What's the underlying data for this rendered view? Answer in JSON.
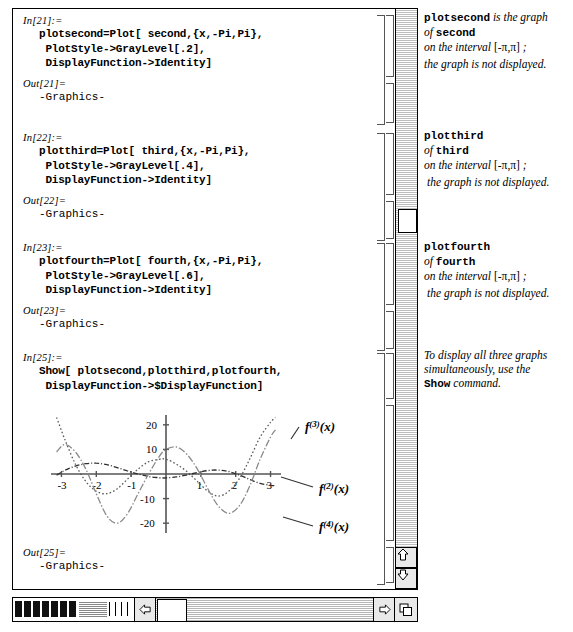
{
  "window": {
    "title": "Mathematica Notebook"
  },
  "cells": [
    {
      "in_label": "In[21]:=",
      "in_code": "plotsecond=Plot[ second,{x,-Pi,Pi},\n PlotStyle->GrayLevel[.2],\n DisplayFunction->Identity]",
      "out_label": "Out[21]=",
      "out_code": "-Graphics-"
    },
    {
      "in_label": "In[22]:=",
      "in_code": "plotthird=Plot[ third,{x,-Pi,Pi},\n PlotStyle->GrayLevel[.4],\n DisplayFunction->Identity]",
      "out_label": "Out[22]=",
      "out_code": "-Graphics-"
    },
    {
      "in_label": "In[23]:=",
      "in_code": "plotfourth=Plot[ fourth,{x,-Pi,Pi},\n PlotStyle->GrayLevel[.6],\n DisplayFunction->Identity]",
      "out_label": "Out[23]=",
      "out_code": "-Graphics-"
    },
    {
      "in_label": "In[25]:=",
      "in_code": "Show[ plotsecond,plotthird,plotfourth,\n DisplayFunction->$DisplayFunction]",
      "out_label": "Out[25]=",
      "out_code": "-Graphics-"
    }
  ],
  "notes": [
    {
      "line1_bold": "plotsecond",
      "line1_rest": " is the graph",
      "line2_pre": "of ",
      "line2_bold": "second",
      "line3": "on the interval ",
      "line3_interval": "[-π,π]",
      "line3_end": " ;",
      "line4": "the graph is not displayed."
    },
    {
      "line1_bold": "plotthird",
      "line1_rest": "",
      "line2_pre": "of ",
      "line2_bold": "third",
      "line3": "on the interval ",
      "line3_interval": "[-π,π]",
      "line3_end": " ;",
      "line4": "the graph is not displayed."
    },
    {
      "line1_bold": "plotfourth",
      "line1_rest": "",
      "line2_pre": "of ",
      "line2_bold": "fourth",
      "line3": "on the interval ",
      "line3_interval": "[-π,π]",
      "line3_end": " ;",
      "line4": "the graph is not displayed."
    }
  ],
  "final_note": {
    "line1": "To display all three graphs",
    "line2": "simultaneously, use the",
    "line3_bold": "Show",
    "line3_rest": " command."
  },
  "chart_data": {
    "type": "line",
    "title": "",
    "xlabel": "",
    "ylabel": "",
    "xlim": [
      -3.3,
      3.3
    ],
    "ylim": [
      -24,
      24
    ],
    "grid": false,
    "xticks": [
      -3,
      -2,
      -1,
      1,
      2,
      3
    ],
    "xtick_labels": [
      "-3",
      "-2",
      "-1",
      "1",
      "2",
      "3"
    ],
    "yticks": [
      20,
      10,
      -10,
      -20
    ],
    "ytick_labels": [
      "20",
      "10",
      "-10",
      "-20"
    ],
    "legend_position": "right-inline",
    "series": [
      {
        "name": "f^(2)(x)",
        "label": "f(2)(x)",
        "style": "dash-dot",
        "graylevel": 0.2,
        "x": [
          -3.14,
          -2.9,
          -2.6,
          -2.3,
          -2.0,
          -1.7,
          -1.4,
          -1.1,
          -0.8,
          -0.5,
          -0.2,
          0.0,
          0.3,
          0.6,
          0.9,
          1.2,
          1.5,
          1.8,
          2.1,
          2.4,
          2.7,
          3.0,
          3.14
        ],
        "y": [
          -0.5,
          1.5,
          3.2,
          4.2,
          4.4,
          3.8,
          2.6,
          1.2,
          0.0,
          -1.0,
          -1.5,
          -1.6,
          -1.2,
          -0.4,
          0.6,
          1.4,
          1.6,
          1.0,
          -0.4,
          -2.2,
          -3.8,
          -4.6,
          -4.8
        ]
      },
      {
        "name": "f^(3)(x)",
        "label": "f(3)(x)",
        "style": "dotted",
        "graylevel": 0.4,
        "x": [
          -3.14,
          -2.9,
          -2.6,
          -2.3,
          -2.0,
          -1.7,
          -1.4,
          -1.1,
          -0.8,
          -0.5,
          -0.2,
          0.0,
          0.3,
          0.6,
          0.9,
          1.2,
          1.5,
          1.8,
          2.1,
          2.4,
          2.7,
          3.0,
          3.14
        ],
        "y": [
          23,
          14,
          4,
          -3,
          -7,
          -8,
          -6,
          -2,
          2,
          5,
          6,
          6,
          4,
          1,
          -3,
          -7,
          -9,
          -7,
          -2,
          6,
          15,
          21,
          23
        ]
      },
      {
        "name": "f^(4)(x)",
        "label": "f(4)(x)",
        "style": "dash-dot-long",
        "graylevel": 0.6,
        "x": [
          -3.14,
          -2.9,
          -2.6,
          -2.3,
          -2.0,
          -1.7,
          -1.4,
          -1.1,
          -0.8,
          -0.5,
          -0.2,
          0.0,
          0.3,
          0.6,
          0.9,
          1.2,
          1.5,
          1.8,
          2.1,
          2.4,
          2.7,
          3.0,
          3.14
        ],
        "y": [
          9,
          12,
          9,
          2,
          -8,
          -17,
          -20,
          -16,
          -8,
          0,
          7,
          10,
          11,
          8,
          2,
          -6,
          -13,
          -16,
          -13,
          -5,
          6,
          15,
          18
        ]
      }
    ],
    "annotations": [
      {
        "text": "f(3)(x)",
        "x": 2.6,
        "y": 21
      },
      {
        "text": "f(2)(x)",
        "x": 3.1,
        "y": -4
      },
      {
        "text": "f(4)(x)",
        "x": 3.1,
        "y": -19
      }
    ]
  },
  "scrollbars": {
    "vertical_thumb_position": "205",
    "horizontal_thumb_position": "left",
    "up_arrow": "scroll-up-arrow",
    "down_arrow": "scroll-down-arrow",
    "left_arrow": "scroll-left-arrow",
    "right_arrow": "scroll-right-arrow",
    "resize_handle": "resize-grip"
  }
}
